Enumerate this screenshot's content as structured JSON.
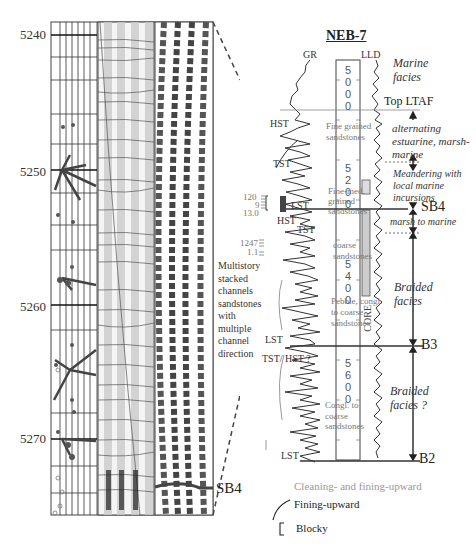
{
  "left_panel": {
    "depth_ticks": [
      "5240",
      "5250",
      "5260",
      "5270"
    ],
    "sb_label": "SB4",
    "annotation": [
      "Multistory",
      "stacked",
      "channels",
      "sandstones",
      "with",
      "multiple",
      "channel",
      "direction"
    ]
  },
  "well_log": {
    "title": "NEB-7",
    "curve_left": "GR",
    "curve_right": "LLD",
    "depth_labels": [
      "5000",
      "5200",
      "5400",
      "5600"
    ],
    "core_label": "CORE",
    "lithology": [
      "Fine grained sandstones",
      "Fine-med. grained sandstones",
      "coarse sandstones",
      "Pebble, congl. to coarse sandstones",
      "Congl. to coarse sandstones"
    ],
    "systems_tracts": [
      "HST",
      "TST",
      "LST",
      "HST",
      "TST",
      "LST",
      "TST/ HST ?",
      "LST"
    ],
    "scale_labels": [
      "120",
      "9",
      "13.0",
      "1247",
      "1.1"
    ],
    "facies": [
      "Marine facies",
      "Top LTAF",
      "alternating estuarine, marsh-marine",
      "Meandering with local marine incursions",
      "marsh to marine",
      "Braided facies",
      "Braided facies ?"
    ],
    "boundaries": [
      "SB4",
      "B3",
      "B2"
    ]
  },
  "legend": {
    "items": [
      {
        "label": "Cleaning- and fining-upward",
        "color": "#999999"
      },
      {
        "label": "Fining-upward",
        "color": "#222222"
      },
      {
        "label": "Blocky",
        "color": "#222222"
      }
    ]
  }
}
